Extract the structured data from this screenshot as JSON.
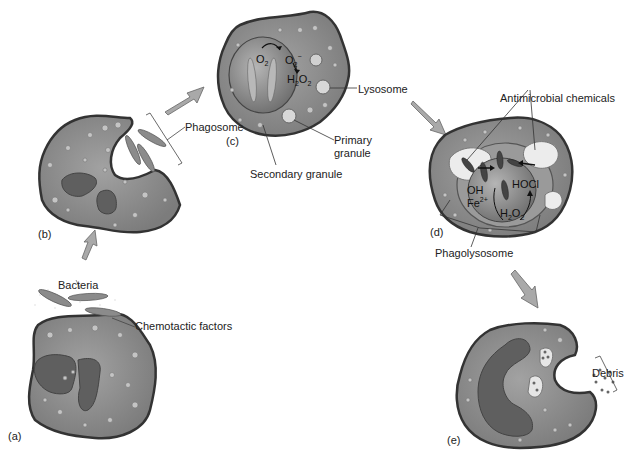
{
  "diagram": {
    "panels": [
      {
        "id": "a",
        "label": "(a)"
      },
      {
        "id": "b",
        "label": "(b)"
      },
      {
        "id": "c",
        "label": "(c)"
      },
      {
        "id": "d",
        "label": "(d)"
      },
      {
        "id": "e",
        "label": "(e)"
      }
    ],
    "labels": {
      "bacteria": "Bacteria",
      "chemotactic_factors": "Chemotactic factors",
      "phagosome": "Phagosome",
      "lysosome": "Lysosome",
      "primary_granule_line1": "Primary",
      "primary_granule_line2": "granule",
      "secondary_granule": "Secondary granule",
      "antimicrobial_chemicals": "Antimicrobial chemicals",
      "phagolysosome": "Phagolysosome",
      "debris": "Debris"
    },
    "chemistry_c": {
      "o2": "O",
      "o2_sub": "2",
      "superoxide": "O",
      "superoxide_sub": "2",
      "superoxide_sup": "−",
      "h2o2_h": "H",
      "h2o2_sub1": "2",
      "h2o2_o": "O",
      "h2o2_sub2": "2"
    },
    "chemistry_d": {
      "oh": "OH",
      "fe": "Fe",
      "fe_sup": "2+",
      "hocl": "HOCl",
      "h2o2_h": "H",
      "h2o2_sub1": "2",
      "h2o2_o": "O",
      "h2o2_sub2": "2"
    },
    "colors": {
      "cell_fill": "#8a8a8a",
      "cell_outline": "#3a3a3a",
      "nucleus": "#5e5e5e",
      "arrow_fill": "#a9a9a9",
      "vacuole": "#e8e8e8"
    }
  }
}
